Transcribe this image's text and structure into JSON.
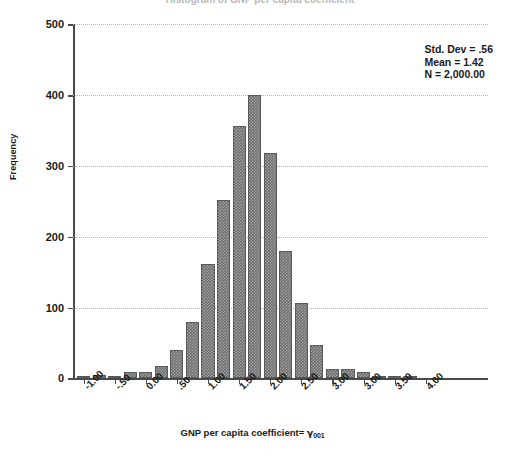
{
  "figure": {
    "title": "Histogram of GNP per capita coefficient"
  },
  "annotation": {
    "std_dev": "Std. Dev = .56",
    "mean": "Mean = 1.42",
    "n": "N = 2,000.00"
  },
  "axes": {
    "y_title": "Frequency",
    "x_title_prefix": "GNP per capita coefficient= ",
    "x_title_symbol": "γ",
    "x_title_subscript": "001"
  },
  "chart_data": {
    "type": "bar",
    "title": "Histogram of GNP per capita coefficient",
    "xlabel": "GNP per capita coefficient= γ001",
    "ylabel": "Frequency",
    "ylim": [
      0,
      500
    ],
    "xlim": [
      -1.25,
      4.0
    ],
    "grid": true,
    "legend": "none",
    "bin_width": 0.25,
    "y_ticks": [
      0,
      100,
      200,
      300,
      400,
      500
    ],
    "y_tick_labels": [
      "0",
      "100",
      "200",
      "300",
      "400",
      "500"
    ],
    "x_tick_labels": [
      "-1.00",
      "-.50",
      "0.00",
      ".50",
      "1.00",
      "1.50",
      "2.00",
      "2.50",
      "3.00",
      "3.00",
      "3.50",
      "4.00"
    ],
    "bin_centers": [
      -1.125,
      -1.0,
      -0.875,
      -0.75,
      -0.625,
      -0.5,
      -0.375,
      -0.25,
      -0.125,
      0.0,
      0.125,
      0.25,
      0.375,
      0.5,
      0.625,
      0.75,
      0.875,
      1.0,
      1.125,
      1.25,
      1.375,
      1.5,
      1.625,
      1.75,
      1.875,
      2.0,
      2.125,
      2.25,
      2.375,
      2.5,
      2.625,
      2.75,
      2.875,
      3.0,
      3.125,
      3.25
    ],
    "categories": [
      "-1.13",
      "-1.00",
      "-0.88",
      "-0.75",
      "-0.63",
      "-0.50",
      "-0.38",
      "-0.25",
      "-0.13",
      "0.00",
      "0.13",
      "0.25",
      "0.38",
      "0.50",
      "0.63",
      "0.75",
      "0.88",
      "1.00",
      "1.13",
      "1.25",
      "1.38",
      "1.50",
      "1.63",
      "1.75",
      "1.88",
      "2.00",
      "2.13",
      "2.25",
      "2.38",
      "2.50",
      "2.63",
      "2.75",
      "2.88",
      "3.00",
      "3.13",
      "3.25"
    ],
    "values": [
      4,
      5,
      4,
      9,
      9,
      18,
      40,
      80,
      162,
      252,
      357,
      400,
      318,
      180,
      107,
      47,
      13,
      13,
      9,
      4,
      4,
      3,
      0,
      0,
      0,
      0,
      0,
      0,
      0,
      0,
      0,
      0,
      0,
      0,
      0,
      0
    ],
    "bars": [
      {
        "label": "-1.13",
        "value": 4
      },
      {
        "label": "-1.00",
        "value": 5
      },
      {
        "label": "-0.88",
        "value": 4
      },
      {
        "label": "-0.75",
        "value": 9
      },
      {
        "label": "-0.63",
        "value": 9
      },
      {
        "label": "-0.50",
        "value": 18
      },
      {
        "label": "-0.38",
        "value": 40
      },
      {
        "label": "-0.25",
        "value": 80
      },
      {
        "label": "-0.13",
        "value": 162
      },
      {
        "label": "0.00",
        "value": 252
      },
      {
        "label": "0.13",
        "value": 357
      },
      {
        "label": "0.25",
        "value": 400
      },
      {
        "label": "0.38",
        "value": 318
      },
      {
        "label": "0.50",
        "value": 180
      },
      {
        "label": "0.63",
        "value": 107
      },
      {
        "label": "0.75",
        "value": 47
      },
      {
        "label": "0.88",
        "value": 13
      },
      {
        "label": "1.00",
        "value": 13
      },
      {
        "label": "1.13",
        "value": 9
      },
      {
        "label": "1.25",
        "value": 4
      },
      {
        "label": "1.38",
        "value": 4
      },
      {
        "label": "1.50",
        "value": 3
      }
    ]
  },
  "colors": {
    "bar_fill": "#6e6e6e",
    "bar_edge": "#5a5a5a",
    "axis": "#4a4a4a",
    "grid": "#b4b4b4",
    "background": "#ffffff",
    "text": "#1a1a1a"
  }
}
